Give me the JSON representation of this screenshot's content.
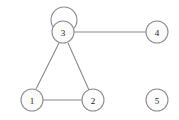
{
  "figure": {
    "type": "undirected-graph-diagram",
    "background_color": "#ffffff",
    "width": 179,
    "height": 120,
    "node_fill_color": "#fbfbfb",
    "node_stroke_color": "#8d8d8d",
    "edge_color": "#8a8a8a",
    "label_color": "#1a1a1a"
  },
  "nodes": [
    {
      "id": "1",
      "label": "1",
      "cx": 32,
      "cy": 100,
      "r": 11
    },
    {
      "id": "2",
      "label": "2",
      "cx": 93,
      "cy": 100,
      "r": 11
    },
    {
      "id": "3",
      "label": "3",
      "cx": 63,
      "cy": 32,
      "r": 11
    },
    {
      "id": "4",
      "label": "4",
      "cx": 157,
      "cy": 32,
      "r": 11
    },
    {
      "id": "5",
      "label": "5",
      "cx": 157,
      "cy": 100,
      "r": 11
    }
  ],
  "edges": [
    {
      "id": "edge-1-2",
      "source": "1",
      "target": "2",
      "x1": 43,
      "y1": 100,
      "x2": 82,
      "y2": 100
    },
    {
      "id": "edge-1-3",
      "source": "1",
      "target": "3",
      "x1": 36,
      "y1": 89,
      "x2": 59,
      "y2": 43
    },
    {
      "id": "edge-2-3",
      "source": "2",
      "target": "3",
      "x1": 89,
      "y1": 90,
      "x2": 68,
      "y2": 43
    },
    {
      "id": "edge-3-4",
      "source": "3",
      "target": "4",
      "x1": 74,
      "y1": 32,
      "x2": 146,
      "y2": 32
    }
  ],
  "self_loops": [
    {
      "id": "loop-3",
      "node": "3",
      "cx": 64,
      "cy": 20,
      "r": 13
    }
  ],
  "isolated_nodes": [
    "5"
  ]
}
